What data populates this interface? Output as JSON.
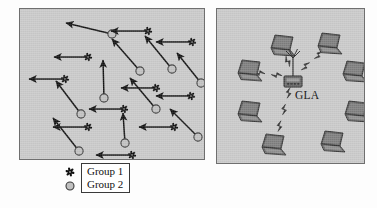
{
  "figure": {
    "background_color": "#fdfdfd",
    "panel_fill": "#c9c9c9",
    "panel_border": "#6f6f6f"
  },
  "legend": {
    "entries": [
      {
        "symbol": "gear-icon",
        "label": "Group 1"
      },
      {
        "symbol": "circle-icon",
        "label": "Group 2"
      }
    ],
    "symbol_colors": {
      "group1": "#111111",
      "group2": "#c0c0c0",
      "group2_stroke": "#3a3a3a"
    }
  },
  "left_panel": {
    "name": "mobility-scenario-panel",
    "node_types": {
      "group1": "gear",
      "group2": "circle"
    },
    "nodes": [
      {
        "type": "group2",
        "x": 92,
        "y": 25,
        "vx": -46,
        "vy": -11
      },
      {
        "type": "group1",
        "x": 128,
        "y": 22,
        "vx": -37,
        "vy": 0
      },
      {
        "type": "group1",
        "x": 68,
        "y": 48,
        "vx": -34,
        "vy": 0
      },
      {
        "type": "group1",
        "x": 172,
        "y": 33,
        "vx": -36,
        "vy": 0
      },
      {
        "type": "group1",
        "x": 45,
        "y": 70,
        "vx": -36,
        "vy": 0
      },
      {
        "type": "group2",
        "x": 120,
        "y": 62,
        "vx": -28,
        "vy": -32
      },
      {
        "type": "group2",
        "x": 152,
        "y": 60,
        "vx": -27,
        "vy": -33
      },
      {
        "type": "group2",
        "x": 84,
        "y": 89,
        "vx": -1,
        "vy": -38
      },
      {
        "type": "group1",
        "x": 136,
        "y": 79,
        "vx": -35,
        "vy": 0
      },
      {
        "type": "group1",
        "x": 171,
        "y": 87,
        "vx": -35,
        "vy": 0
      },
      {
        "type": "group2",
        "x": 61,
        "y": 105,
        "vx": -25,
        "vy": -33
      },
      {
        "type": "group1",
        "x": 104,
        "y": 100,
        "vx": -35,
        "vy": 0
      },
      {
        "type": "group2",
        "x": 136,
        "y": 100,
        "vx": -26,
        "vy": -31
      },
      {
        "type": "group2",
        "x": 181,
        "y": 74,
        "vx": -24,
        "vy": -30
      },
      {
        "type": "group1",
        "x": 68,
        "y": 118,
        "vx": -35,
        "vy": 0
      },
      {
        "type": "group1",
        "x": 154,
        "y": 118,
        "vx": -35,
        "vy": 0
      },
      {
        "type": "group2",
        "x": 59,
        "y": 142,
        "vx": -26,
        "vy": -33
      },
      {
        "type": "group2",
        "x": 105,
        "y": 134,
        "vx": -2,
        "vy": -30
      },
      {
        "type": "group1",
        "x": 112,
        "y": 146,
        "vx": -36,
        "vy": 0
      },
      {
        "type": "group2",
        "x": 178,
        "y": 128,
        "vx": -28,
        "vy": -28
      }
    ],
    "arrow_color": "#111111"
  },
  "right_panel": {
    "name": "wireless-topology-panel",
    "access_point": {
      "label": "GLA",
      "x": 76,
      "y": 68,
      "icon": "access-point-icon"
    },
    "clients": [
      {
        "icon": "laptop-icon",
        "x": 54,
        "y": 26
      },
      {
        "icon": "laptop-icon",
        "x": 101,
        "y": 24
      },
      {
        "icon": "laptop-icon",
        "x": 21,
        "y": 51
      },
      {
        "icon": "laptop-icon",
        "x": 126,
        "y": 52
      },
      {
        "icon": "laptop-icon",
        "x": 21,
        "y": 92
      },
      {
        "icon": "laptop-icon",
        "x": 128,
        "y": 92
      },
      {
        "icon": "laptop-icon",
        "x": 45,
        "y": 125
      },
      {
        "icon": "laptop-icon",
        "x": 104,
        "y": 122
      }
    ],
    "links": [
      {
        "from": "access_point",
        "to": 0,
        "style": "wireless-bolt"
      },
      {
        "from": "access_point",
        "to": 1,
        "style": "wireless-bolt"
      },
      {
        "from": "access_point",
        "to": 2,
        "style": "wireless-bolt"
      },
      {
        "from": "access_point",
        "to": 6,
        "style": "wireless-bolt"
      }
    ],
    "link_color": "#2b2b2b"
  }
}
